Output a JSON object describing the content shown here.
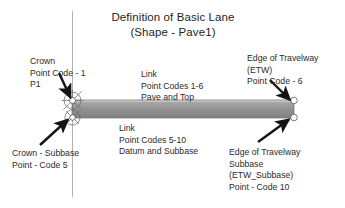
{
  "title": {
    "line1": "Definition of Basic Lane",
    "line2": "(Shape - Pave1)"
  },
  "annotations": {
    "crown": {
      "line1": "Crown",
      "line2": "Point Code - 1",
      "line3": "P1"
    },
    "link_top": {
      "line1": "Link",
      "line2": "Point Codes 1-6",
      "line3": "Pave and Top"
    },
    "etw": {
      "line1": "Edge of Travelway",
      "line2": "(ETW)",
      "line3": "Point Code - 6"
    },
    "crown_subbase": {
      "line1": "Crown - Subbase",
      "line2": "Point - Code 5"
    },
    "link_bottom": {
      "line1": "Link",
      "line2": "Point Codes 5-10",
      "line3": "Datum and Subbase"
    },
    "etw_subbase": {
      "line1": "Edge of Travelway",
      "line2": "Subbase",
      "line3": "(ETW_Subbase)",
      "line4": "Point - Code 10"
    }
  },
  "colors": {
    "background": "#ffffff",
    "text": "#2b2b2b",
    "slab_top": "#9a9a9a",
    "slab_bottom": "#7e7e7e",
    "slab_highlight": "#c9c9c9",
    "slab_outline": "#6b6b6b",
    "arrow": "#141414",
    "centerline": "#a9a9a9",
    "marker_outline": "#6e6e6e"
  },
  "graphics": {
    "centerline": "vertical-centerline",
    "slab": "pavement-slab",
    "markers": [
      "crown-point-marker",
      "crown-subbase-marker",
      "etw-point-marker",
      "etw-subbase-marker"
    ],
    "arrows": [
      "crown-arrow",
      "crown-subbase-arrow",
      "etw-arrow",
      "etw-subbase-arrow"
    ]
  }
}
